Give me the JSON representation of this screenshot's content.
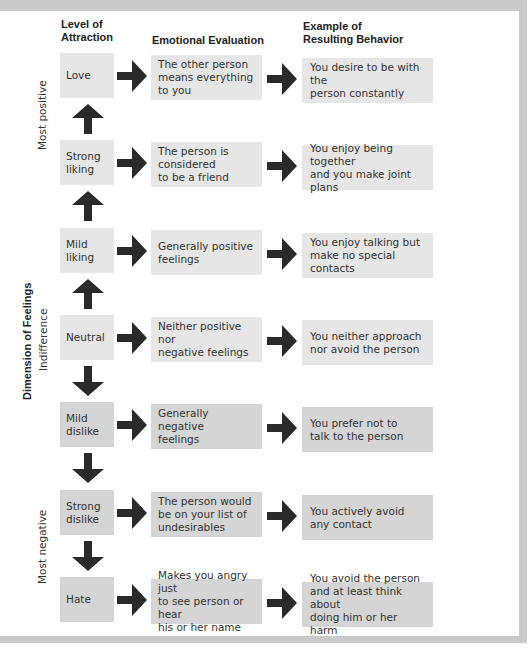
{
  "headers": {
    "level": "Level of\nAttraction",
    "evaluation": "Emotional Evaluation",
    "behavior": "Example of\nResulting Behavior"
  },
  "axis": {
    "title": "Dimension of Feelings",
    "top_label": "Most positive",
    "middle_label": "Indifference",
    "bottom_label": "Most negative"
  },
  "rows": [
    {
      "level": "Love",
      "evaluation": "The other person\nmeans everything\nto you",
      "behavior": "You desire to be with the\nperson constantly",
      "tone": "positive"
    },
    {
      "level": "Strong\nliking",
      "evaluation": "The person is\nconsidered\nto be a friend",
      "behavior": "You enjoy being together\nand you make joint plans",
      "tone": "positive"
    },
    {
      "level": "Mild\nliking",
      "evaluation": "Generally positive\nfeelings",
      "behavior": "You enjoy talking but\nmake no special contacts",
      "tone": "positive"
    },
    {
      "level": "Neutral",
      "evaluation": "Neither positive nor\nnegative feelings",
      "behavior": "You neither approach\nnor avoid the person",
      "tone": "neutral"
    },
    {
      "level": "Mild\ndislike",
      "evaluation": "Generally negative\nfeelings",
      "behavior": "You prefer not to\ntalk to the person",
      "tone": "negative"
    },
    {
      "level": "Strong\ndislike",
      "evaluation": "The person would\nbe on your list of\nundesirables",
      "behavior": "You actively avoid\nany contact",
      "tone": "negative"
    },
    {
      "level": "Hate",
      "evaluation": "Makes you angry just\nto see person or hear\nhis or her name",
      "behavior": "You avoid the person\nand at least think about\ndoing him or her harm",
      "tone": "negative"
    }
  ],
  "icons": {
    "right_arrow": "arrow-right-icon",
    "up_arrow": "arrow-up-icon",
    "down_arrow": "arrow-down-icon"
  },
  "colors": {
    "box_light": "#e6e6e6",
    "box_dark": "#d5d5d5",
    "arrow": "#2a2a2a",
    "frame": "#c9c9c9"
  }
}
